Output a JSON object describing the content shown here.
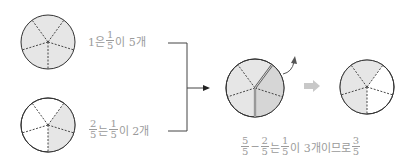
{
  "diagram": {
    "top": {
      "label_prefix": "1은",
      "fraction": {
        "num": "1",
        "den": "5"
      },
      "label_suffix": "이 5개"
    },
    "bottom": {
      "fraction_a": {
        "num": "2",
        "den": "5"
      },
      "label_mid": "는",
      "fraction_b": {
        "num": "1",
        "den": "5"
      },
      "label_suffix": "이 2개"
    },
    "result": {
      "fraction_a": {
        "num": "5",
        "den": "5"
      },
      "minus": "−",
      "fraction_b": {
        "num": "2",
        "den": "5"
      },
      "label_mid": "는",
      "fraction_c": {
        "num": "1",
        "den": "5"
      },
      "label_mid2": "이 3개이므로",
      "fraction_d": {
        "num": "3",
        "den": "5"
      }
    },
    "colors": {
      "fill": "#e6e6e6",
      "fill_dark": "#d9d9d9",
      "stroke": "#333333",
      "text": "#9a9a9a",
      "hollow_arrow": "#c8c8c8"
    }
  }
}
